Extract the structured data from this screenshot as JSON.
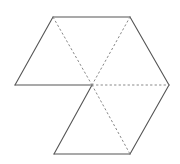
{
  "diagram": {
    "stroke_color": "#555555",
    "dotted_color": "#888888",
    "vertices": {
      "C": [
        92,
        85
      ],
      "TL": [
        53,
        17
      ],
      "TR": [
        130,
        17
      ],
      "L": [
        15,
        85
      ],
      "R": [
        169,
        85
      ],
      "BL": [
        54,
        154
      ],
      "BR": [
        130,
        154
      ]
    },
    "solid_edges": [
      [
        "TL",
        "TR"
      ],
      [
        "TR",
        "R"
      ],
      [
        "R",
        "BR"
      ],
      [
        "BR",
        "BL"
      ],
      [
        "BL",
        "C"
      ],
      [
        "C",
        "L"
      ],
      [
        "L",
        "TL"
      ]
    ],
    "dotted_edges": [
      [
        "C",
        "TL"
      ],
      [
        "C",
        "TR"
      ],
      [
        "C",
        "R"
      ],
      [
        "C",
        "BR"
      ]
    ]
  }
}
